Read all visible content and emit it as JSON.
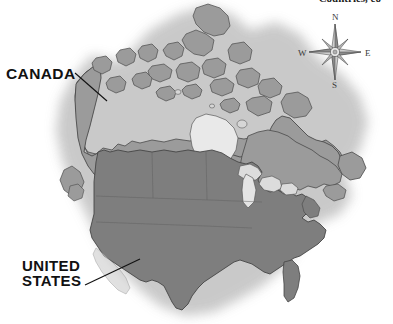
{
  "figure": {
    "kind": "reference-map",
    "header_text_partial": "Countries, co",
    "background_color": "#ffffff",
    "halo_color": "#d8d8d8"
  },
  "labels": {
    "canada": "CANADA",
    "united_states": "UNITED\nSTATES"
  },
  "compass": {
    "name": "compass-rose",
    "north": "N",
    "east": "E",
    "south": "S",
    "west": "W"
  },
  "regions": [
    {
      "id": "canada",
      "name": "Canada",
      "fill": "#9b9b9b",
      "stroke": "#4a4a4a",
      "label": "CANADA"
    },
    {
      "id": "united-states",
      "name": "United States",
      "fill": "#7e7e7e",
      "stroke": "#454545",
      "label": "UNITED STATES"
    },
    {
      "id": "water",
      "name": "Water bodies (Hudson Bay, Great Lakes)",
      "fill": "#e9e9e9",
      "stroke": "#5a5a5a",
      "label": ""
    }
  ],
  "colors": {
    "canada_fill": "#9b9b9b",
    "us_fill": "#7e7e7e",
    "water_fill": "#e9e9e9",
    "coast_stroke": "#4a4a4a",
    "label_color": "#111111",
    "compass_color": "#3a3a3a"
  }
}
